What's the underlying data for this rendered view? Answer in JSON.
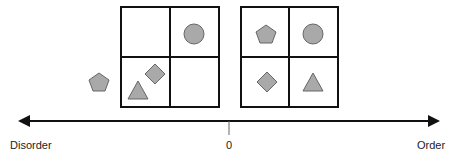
{
  "axis": {
    "left_label": "Disorder",
    "center_label": "0",
    "right_label": "Order"
  },
  "colors": {
    "shape_fill": "#a9a9a9",
    "shape_stroke": "#666666",
    "line": "#111111"
  },
  "left_panel": {
    "grid": "2x2",
    "shapes": [
      "circle (top-right cell)",
      "diamond (bottom-left cell)",
      "triangle (bottom-left cell)",
      "pentagon (outside grid)"
    ]
  },
  "right_panel": {
    "grid": "2x2",
    "shapes": [
      "pentagon (top-left)",
      "circle (top-right)",
      "diamond (bottom-left)",
      "triangle (bottom-right)"
    ]
  }
}
